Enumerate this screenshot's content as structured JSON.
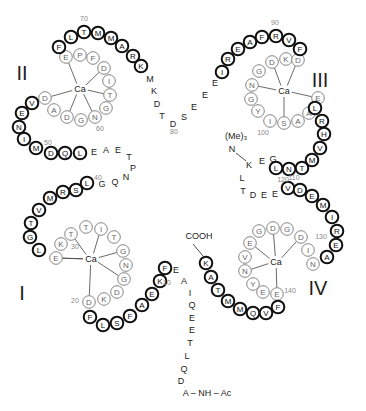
{
  "colors": {
    "helix_stroke": "#111111",
    "loop_stroke": "#777777",
    "loop_text": "#666666",
    "number_text": "#888888",
    "text": "#222222"
  },
  "domains": [
    {
      "label": "I",
      "x": 22,
      "y": 300,
      "ca": {
        "label": "Ca",
        "x": 91,
        "y": 259
      }
    },
    {
      "label": "II",
      "x": 22,
      "y": 80,
      "ca": {
        "label": "Ca",
        "x": 80,
        "y": 89
      }
    },
    {
      "label": "III",
      "x": 320,
      "y": 87,
      "ca": {
        "label": "Ca",
        "x": 284,
        "y": 91
      }
    },
    {
      "label": "IV",
      "x": 318,
      "y": 295,
      "ca": {
        "label": "Ca",
        "x": 276,
        "y": 262
      }
    }
  ],
  "residues_bold": [
    {
      "aa": "F",
      "x": 59,
      "y": 47
    },
    {
      "aa": "L",
      "x": 71,
      "y": 37
    },
    {
      "aa": "T",
      "x": 84,
      "y": 32
    },
    {
      "aa": "M",
      "x": 98,
      "y": 33
    },
    {
      "aa": "M",
      "x": 111,
      "y": 38
    },
    {
      "aa": "A",
      "x": 122,
      "y": 46
    },
    {
      "aa": "R",
      "x": 133,
      "y": 56
    },
    {
      "aa": "K",
      "x": 141,
      "y": 66
    },
    {
      "aa": "V",
      "x": 32,
      "y": 103
    },
    {
      "aa": "E",
      "x": 22,
      "y": 113
    },
    {
      "aa": "N",
      "x": 19,
      "y": 127
    },
    {
      "aa": "I",
      "x": 24,
      "y": 139
    },
    {
      "aa": "M",
      "x": 36,
      "y": 148
    },
    {
      "aa": "D",
      "x": 51,
      "y": 153
    },
    {
      "aa": "Q",
      "x": 65,
      "y": 153
    },
    {
      "aa": "L",
      "x": 80,
      "y": 153
    },
    {
      "aa": "L",
      "x": 87,
      "y": 183
    },
    {
      "aa": "S",
      "x": 76,
      "y": 190
    },
    {
      "aa": "R",
      "x": 63,
      "y": 192
    },
    {
      "aa": "M",
      "x": 50,
      "y": 198
    },
    {
      "aa": "V",
      "x": 39,
      "y": 210
    },
    {
      "aa": "T",
      "x": 31,
      "y": 223
    },
    {
      "aa": "G",
      "x": 30,
      "y": 237
    },
    {
      "aa": "L",
      "x": 39,
      "y": 250
    },
    {
      "aa": "F",
      "x": 90,
      "y": 317
    },
    {
      "aa": "L",
      "x": 103,
      "y": 325
    },
    {
      "aa": "S",
      "x": 117,
      "y": 323
    },
    {
      "aa": "F",
      "x": 130,
      "y": 316
    },
    {
      "aa": "A",
      "x": 142,
      "y": 305
    },
    {
      "aa": "E",
      "x": 152,
      "y": 294
    },
    {
      "aa": "K",
      "x": 160,
      "y": 281
    },
    {
      "aa": "F",
      "x": 165,
      "y": 268
    },
    {
      "aa": "I",
      "x": 222,
      "y": 72
    },
    {
      "aa": "R",
      "x": 228,
      "y": 59
    },
    {
      "aa": "E",
      "x": 238,
      "y": 49
    },
    {
      "aa": "A",
      "x": 250,
      "y": 42
    },
    {
      "aa": "F",
      "x": 262,
      "y": 37
    },
    {
      "aa": "R",
      "x": 276,
      "y": 36
    },
    {
      "aa": "V",
      "x": 289,
      "y": 40
    },
    {
      "aa": "F",
      "x": 300,
      "y": 49
    },
    {
      "aa": "L",
      "x": 315,
      "y": 108
    },
    {
      "aa": "R",
      "x": 322,
      "y": 121
    },
    {
      "aa": "H",
      "x": 324,
      "y": 134
    },
    {
      "aa": "V",
      "x": 320,
      "y": 148
    },
    {
      "aa": "M",
      "x": 312,
      "y": 160
    },
    {
      "aa": "T",
      "x": 302,
      "y": 168
    },
    {
      "aa": "N",
      "x": 289,
      "y": 169
    },
    {
      "aa": "L",
      "x": 276,
      "y": 168
    },
    {
      "aa": "V",
      "x": 288,
      "y": 188
    },
    {
      "aa": "D",
      "x": 300,
      "y": 190
    },
    {
      "aa": "E",
      "x": 312,
      "y": 196
    },
    {
      "aa": "M",
      "x": 323,
      "y": 205
    },
    {
      "aa": "I",
      "x": 332,
      "y": 217
    },
    {
      "aa": "R",
      "x": 337,
      "y": 231
    },
    {
      "aa": "E",
      "x": 336,
      "y": 245
    },
    {
      "aa": "A",
      "x": 327,
      "y": 257
    },
    {
      "aa": "K",
      "x": 206,
      "y": 263
    },
    {
      "aa": "A",
      "x": 211,
      "y": 277
    },
    {
      "aa": "T",
      "x": 218,
      "y": 290
    },
    {
      "aa": "M",
      "x": 228,
      "y": 301
    },
    {
      "aa": "M",
      "x": 240,
      "y": 309
    },
    {
      "aa": "Q",
      "x": 253,
      "y": 313
    },
    {
      "aa": "V",
      "x": 266,
      "y": 313
    },
    {
      "aa": "F",
      "x": 278,
      "y": 307
    }
  ],
  "residues_loop": [
    {
      "aa": "E",
      "x": 66,
      "y": 57
    },
    {
      "aa": "P",
      "x": 80,
      "y": 55
    },
    {
      "aa": "F",
      "x": 93,
      "y": 58
    },
    {
      "aa": "D",
      "x": 104,
      "y": 68
    },
    {
      "aa": "I",
      "x": 109,
      "y": 81
    },
    {
      "aa": "T",
      "x": 110,
      "y": 95
    },
    {
      "aa": "G",
      "x": 106,
      "y": 108
    },
    {
      "aa": "N",
      "x": 95,
      "y": 117
    },
    {
      "aa": "G",
      "x": 81,
      "y": 120
    },
    {
      "aa": "D",
      "x": 67,
      "y": 117
    },
    {
      "aa": "A",
      "x": 54,
      "y": 110
    },
    {
      "aa": "D",
      "x": 45,
      "y": 98
    },
    {
      "aa": "E",
      "x": 56,
      "y": 258
    },
    {
      "aa": "K",
      "x": 61,
      "y": 244
    },
    {
      "aa": "T",
      "x": 71,
      "y": 234
    },
    {
      "aa": "T",
      "x": 86,
      "y": 227
    },
    {
      "aa": "I",
      "x": 101,
      "y": 229
    },
    {
      "aa": "T",
      "x": 114,
      "y": 237
    },
    {
      "aa": "G",
      "x": 123,
      "y": 251
    },
    {
      "aa": "N",
      "x": 126,
      "y": 265
    },
    {
      "aa": "G",
      "x": 124,
      "y": 279
    },
    {
      "aa": "D",
      "x": 117,
      "y": 292
    },
    {
      "aa": "K",
      "x": 104,
      "y": 299
    },
    {
      "aa": "D",
      "x": 89,
      "y": 302
    },
    {
      "aa": "D",
      "x": 272,
      "y": 62
    },
    {
      "aa": "K",
      "x": 286,
      "y": 59
    },
    {
      "aa": "D",
      "x": 298,
      "y": 60
    },
    {
      "aa": "G",
      "x": 259,
      "y": 71
    },
    {
      "aa": "N",
      "x": 252,
      "y": 85
    },
    {
      "aa": "G",
      "x": 251,
      "y": 99
    },
    {
      "aa": "Y",
      "x": 258,
      "y": 111
    },
    {
      "aa": "I",
      "x": 270,
      "y": 121
    },
    {
      "aa": "S",
      "x": 284,
      "y": 123
    },
    {
      "aa": "A",
      "x": 298,
      "y": 121
    },
    {
      "aa": "A",
      "x": 309,
      "y": 113
    },
    {
      "aa": "E",
      "x": 318,
      "y": 98
    },
    {
      "aa": "E",
      "x": 250,
      "y": 243
    },
    {
      "aa": "G",
      "x": 259,
      "y": 231
    },
    {
      "aa": "D",
      "x": 273,
      "y": 228
    },
    {
      "aa": "G",
      "x": 287,
      "y": 229
    },
    {
      "aa": "D",
      "x": 301,
      "y": 237
    },
    {
      "aa": "I",
      "x": 308,
      "y": 250
    },
    {
      "aa": "N",
      "x": 313,
      "y": 264
    },
    {
      "aa": "V",
      "x": 245,
      "y": 257
    },
    {
      "aa": "N",
      "x": 245,
      "y": 271
    },
    {
      "aa": "Y",
      "x": 253,
      "y": 284
    },
    {
      "aa": "E",
      "x": 263,
      "y": 292
    },
    {
      "aa": "E",
      "x": 277,
      "y": 294
    }
  ],
  "residues_plain": [
    {
      "aa": "M",
      "x": 150,
      "y": 79
    },
    {
      "aa": "K",
      "x": 154,
      "y": 91
    },
    {
      "aa": "D",
      "x": 157,
      "y": 104
    },
    {
      "aa": "T",
      "x": 162,
      "y": 116
    },
    {
      "aa": "D",
      "x": 173,
      "y": 124
    },
    {
      "aa": "S",
      "x": 184,
      "y": 117
    },
    {
      "aa": "E",
      "x": 194,
      "y": 107
    },
    {
      "aa": "E",
      "x": 205,
      "y": 95
    },
    {
      "aa": "E",
      "x": 215,
      "y": 83
    },
    {
      "aa": "E",
      "x": 94,
      "y": 152
    },
    {
      "aa": "A",
      "x": 106,
      "y": 150
    },
    {
      "aa": "E",
      "x": 118,
      "y": 150
    },
    {
      "aa": "T",
      "x": 129,
      "y": 157
    },
    {
      "aa": "P",
      "x": 133,
      "y": 168
    },
    {
      "aa": "N",
      "x": 126,
      "y": 177
    },
    {
      "aa": "Q",
      "x": 115,
      "y": 182
    },
    {
      "aa": "G",
      "x": 102,
      "y": 184
    },
    {
      "aa": "N",
      "x": 232,
      "y": 149
    },
    {
      "aa": "K",
      "x": 249,
      "y": 165
    },
    {
      "aa": "E",
      "x": 262,
      "y": 161
    },
    {
      "aa": "G",
      "x": 273,
      "y": 159
    },
    {
      "aa": "L",
      "x": 242,
      "y": 178
    },
    {
      "aa": "T",
      "x": 243,
      "y": 191
    },
    {
      "aa": "D",
      "x": 253,
      "y": 195
    },
    {
      "aa": "E",
      "x": 264,
      "y": 195
    },
    {
      "aa": "E",
      "x": 275,
      "y": 194
    },
    {
      "aa": "E",
      "x": 176,
      "y": 270
    },
    {
      "aa": "A",
      "x": 184,
      "y": 281
    },
    {
      "aa": "I",
      "x": 190,
      "y": 293
    },
    {
      "aa": "Q",
      "x": 192,
      "y": 305
    },
    {
      "aa": "E",
      "x": 192,
      "y": 318
    },
    {
      "aa": "E",
      "x": 192,
      "y": 330
    },
    {
      "aa": "T",
      "x": 190,
      "y": 343
    },
    {
      "aa": "L",
      "x": 187,
      "y": 356
    },
    {
      "aa": "Q",
      "x": 184,
      "y": 369
    },
    {
      "aa": "D",
      "x": 181,
      "y": 381
    }
  ],
  "numbers": [
    {
      "label": "70",
      "x": 84,
      "y": 21
    },
    {
      "label": "60",
      "x": 100,
      "y": 131
    },
    {
      "label": "50",
      "x": 48,
      "y": 145
    },
    {
      "label": "40",
      "x": 98,
      "y": 180
    },
    {
      "label": "30",
      "x": 75,
      "y": 249
    },
    {
      "label": "20",
      "x": 75,
      "y": 303
    },
    {
      "label": "10",
      "x": 167,
      "y": 285
    },
    {
      "label": "80",
      "x": 174,
      "y": 134
    },
    {
      "label": "90",
      "x": 275,
      "y": 25
    },
    {
      "label": "100",
      "x": 263,
      "y": 135
    },
    {
      "label": "110",
      "x": 294,
      "y": 180
    },
    {
      "label": "120",
      "x": 283,
      "y": 182
    },
    {
      "label": "130",
      "x": 321,
      "y": 239
    },
    {
      "label": "140",
      "x": 290,
      "y": 293
    }
  ],
  "labels": {
    "methyl": {
      "text": "(Me)₃",
      "x": 236,
      "y": 139
    },
    "cooh": {
      "text": "COOH",
      "x": 199,
      "y": 239
    },
    "n_terminus": {
      "text": "A – NH – Ac",
      "x": 207,
      "y": 396
    }
  }
}
